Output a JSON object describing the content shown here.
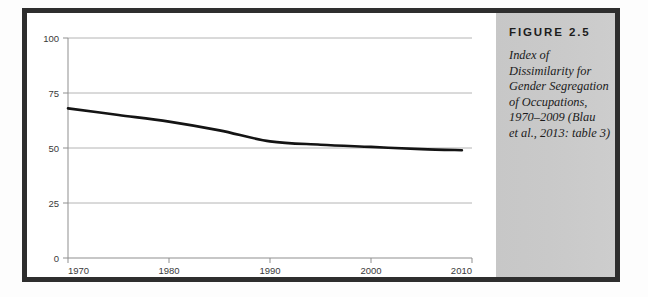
{
  "figure": {
    "caption_title": "FIGURE 2.5",
    "caption_lines": [
      "Index of",
      "Dissimilarity for",
      "Gender Segregation",
      "of Occupations,",
      "1970–2009 (Blau",
      "et al., 2013: table 3)"
    ]
  },
  "colors": {
    "frame": "#2e2e2e",
    "caption_panel": "#c9c9c9",
    "series": "#141414",
    "gridline": "#b4b4b4",
    "axis": "#8f8f8f",
    "page": "#ffffff"
  },
  "chart_data": {
    "type": "line",
    "title": "",
    "xlabel": "",
    "ylabel": "",
    "xlim": [
      1970,
      2010
    ],
    "ylim": [
      0,
      100
    ],
    "grid": true,
    "legend": "none",
    "xticks": [
      "1970",
      "1980",
      "1990",
      "2000",
      "2010"
    ],
    "yticks": [
      "0",
      "25",
      "50",
      "75",
      "100"
    ],
    "x": [
      1970,
      1975,
      1980,
      1985,
      1990,
      1995,
      2000,
      2005,
      2009
    ],
    "series": [
      {
        "name": "Index of Dissimilarity",
        "values": [
          68,
          65,
          62,
          58,
          53,
          51.5,
          50.5,
          49.5,
          49
        ]
      }
    ]
  }
}
